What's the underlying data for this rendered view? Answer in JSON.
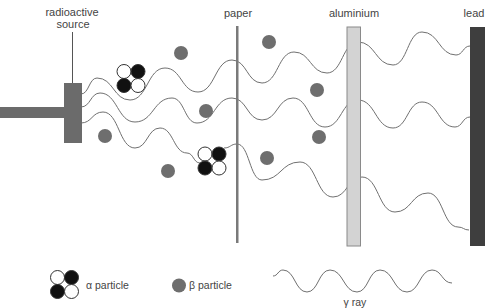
{
  "labels": {
    "source_line1": "radioactive",
    "source_line2": "source",
    "paper": "paper",
    "aluminium": "aluminium",
    "lead": "lead"
  },
  "legend": {
    "alpha_label": "α particle",
    "beta_label": "β particle",
    "gamma_label": "γ ray"
  },
  "colors": {
    "source": "#6b6b6b",
    "paper": "#7a7a7a",
    "aluminium_fill": "#d3d3d3",
    "aluminium_stroke": "#8a8a8a",
    "lead": "#3e3e3e",
    "beta": "#6e6e6e",
    "wave": "#707070",
    "alpha_dark": "#111111",
    "alpha_light": "#ffffff",
    "alpha_stroke": "#333333"
  },
  "alpha_particles": [
    {
      "cx": 131,
      "cy": 78.5
    },
    {
      "cx": 212,
      "cy": 161
    }
  ],
  "beta_particles": [
    {
      "cx": 181,
      "cy": 53
    },
    {
      "cx": 269,
      "cy": 42
    },
    {
      "cx": 105,
      "cy": 136
    },
    {
      "cx": 206,
      "cy": 111
    },
    {
      "cx": 317,
      "cy": 90
    },
    {
      "cx": 319,
      "cy": 137
    },
    {
      "cx": 267,
      "cy": 158
    },
    {
      "cx": 168,
      "cy": 171
    }
  ],
  "rays": [
    {
      "name": "gamma-ray-top",
      "points": [
        [
          81,
          94
        ],
        [
          97,
          78
        ],
        [
          130,
          100
        ],
        [
          165,
          68
        ],
        [
          198,
          92
        ],
        [
          232,
          60
        ],
        [
          262,
          83
        ],
        [
          294,
          52
        ],
        [
          327,
          73
        ],
        [
          358,
          42
        ],
        [
          393,
          65
        ],
        [
          422,
          32
        ],
        [
          456,
          55
        ],
        [
          470,
          46
        ]
      ]
    },
    {
      "name": "gamma-ray-middle",
      "points": [
        [
          81,
          107
        ],
        [
          100,
          93
        ],
        [
          135,
          122
        ],
        [
          172,
          98
        ],
        [
          197,
          123
        ],
        [
          232,
          98
        ],
        [
          262,
          120
        ],
        [
          293,
          98
        ],
        [
          325,
          127
        ],
        [
          358,
          100
        ],
        [
          393,
          128
        ],
        [
          422,
          102
        ],
        [
          455,
          127
        ],
        [
          470,
          117
        ]
      ]
    },
    {
      "name": "gamma-ray-bottom-a",
      "points": [
        [
          81,
          123
        ],
        [
          103,
          112
        ],
        [
          135,
          148
        ],
        [
          160,
          128
        ],
        [
          187,
          153
        ],
        [
          200,
          163
        ]
      ]
    },
    {
      "name": "gamma-ray-bottom-b",
      "points": [
        [
          224,
          148
        ],
        [
          237,
          144
        ],
        [
          262,
          180
        ],
        [
          300,
          162
        ],
        [
          333,
          197
        ],
        [
          362,
          177
        ],
        [
          395,
          212
        ],
        [
          428,
          193
        ],
        [
          458,
          227
        ],
        [
          469,
          230
        ]
      ]
    }
  ],
  "legend_wave": [
    [
      273,
      276
    ],
    [
      283,
      270
    ],
    [
      307,
      292
    ],
    [
      330,
      270
    ],
    [
      357,
      292
    ],
    [
      380,
      270
    ],
    [
      407,
      292
    ],
    [
      432,
      270
    ],
    [
      452,
      283
    ]
  ]
}
